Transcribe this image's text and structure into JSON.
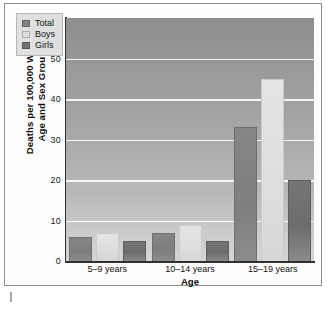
{
  "chart_data": {
    "type": "bar",
    "title": "",
    "subtitle": "",
    "xlabel": "Age",
    "ylabel": "Deaths per 100,000 Within Age and Sex Groups",
    "ylabel_line1": "Deaths per 100,000 Within",
    "ylabel_line2": "Age and Sex Groups",
    "categories": [
      "5–9 years",
      "10–14 years",
      "15–19 years"
    ],
    "series": [
      {
        "name": "Total",
        "values": [
          6,
          7,
          33
        ],
        "color": "#828282"
      },
      {
        "name": "Boys",
        "values": [
          7,
          9,
          45
        ],
        "color": "#dedede"
      },
      {
        "name": "Girls",
        "values": [
          5,
          5,
          20
        ],
        "color": "#707070"
      }
    ],
    "ylim": [
      0,
      60
    ],
    "yticks": [
      0,
      10,
      20,
      30,
      40,
      50,
      60
    ],
    "ytick_labels": [
      "0",
      "10",
      "20",
      "30",
      "40",
      "50",
      "60"
    ],
    "gridlines": [
      10,
      20,
      30,
      40,
      50
    ],
    "grid": true,
    "legend_position": "upper-left",
    "legend_entries": [
      "Total",
      "Boys",
      "Girls"
    ],
    "plot_background": "gray-vertical-gradient",
    "gridline_color": "#ffffff",
    "axis_color": "#303030",
    "frame_color": "#8d8d8d"
  }
}
